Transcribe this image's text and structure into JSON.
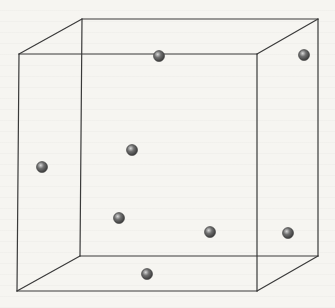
{
  "diagram": {
    "type": "cubic-unit-cell",
    "colors": {
      "edge": "#3a3a3a",
      "atom_dark": "#3c3c3c",
      "atom_mid": "#707070",
      "atom_highlight": "#d8d8d8",
      "background": "#f6f5f1"
    },
    "cube": {
      "front": {
        "top_left": [
          19,
          54
        ],
        "top_right": [
          257,
          54
        ],
        "bottom_right": [
          257,
          291
        ],
        "bottom_left": [
          17,
          291
        ]
      },
      "back": {
        "top_left": [
          82,
          19
        ],
        "top_right": [
          318,
          19
        ],
        "bottom_right": [
          318,
          256
        ],
        "bottom_left": [
          80,
          256
        ]
      }
    },
    "atoms": [
      {
        "id": "atom-top-front-edge",
        "x": 159,
        "y": 56,
        "r": 5.5
      },
      {
        "id": "atom-top-right-back",
        "x": 304,
        "y": 55,
        "r": 5.5
      },
      {
        "id": "atom-center-back-face",
        "x": 132,
        "y": 150,
        "r": 5.5
      },
      {
        "id": "atom-left-face",
        "x": 42,
        "y": 167,
        "r": 5.5
      },
      {
        "id": "atom-lower-back-left",
        "x": 119,
        "y": 218,
        "r": 5.5
      },
      {
        "id": "atom-lower-center",
        "x": 210,
        "y": 232,
        "r": 5.5
      },
      {
        "id": "atom-right-face",
        "x": 288,
        "y": 233,
        "r": 5.5
      },
      {
        "id": "atom-bottom-face",
        "x": 147,
        "y": 274,
        "r": 5.5
      }
    ]
  }
}
